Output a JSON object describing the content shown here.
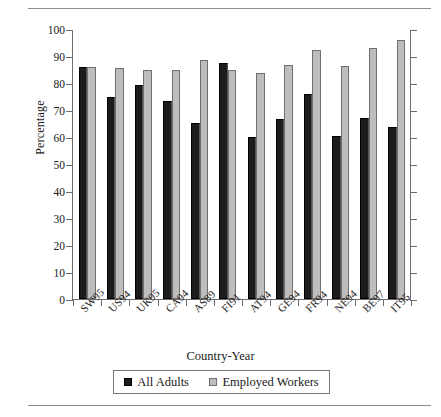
{
  "figure": {
    "top_rule": "horizontal-rule",
    "bottom_rule": "horizontal-rule"
  },
  "chart_data": {
    "type": "bar",
    "title": "",
    "xlabel": "Country-Year",
    "ylabel": "Percentage",
    "ylim": [
      0,
      100
    ],
    "ytick_step": 10,
    "ytick_labels": [
      "0",
      "10",
      "20",
      "30",
      "40",
      "50",
      "60",
      "70",
      "80",
      "90",
      "100"
    ],
    "grid": false,
    "legend_position": "bottom",
    "categories": [
      "SW95",
      "US94",
      "UK95",
      "CA94",
      "AS89",
      "FI91",
      "AT94",
      "GE94",
      "FR94",
      "NE94",
      "BE97",
      "IT95"
    ],
    "series": [
      {
        "name": "All Adults",
        "color": "#1c1c1c",
        "values": [
          86,
          74.7,
          79.3,
          73.5,
          65.3,
          87.5,
          60,
          66.6,
          75.8,
          60.2,
          67.2,
          63.7
        ]
      },
      {
        "name": "Employed Workers",
        "color": "#bdbdbd",
        "values": [
          86,
          85.4,
          84.7,
          84.8,
          88.7,
          85,
          83.6,
          86.5,
          92.3,
          86.2,
          92.9,
          96
        ]
      }
    ]
  },
  "legend": {
    "items": [
      {
        "label": "All Adults",
        "swatch": "dark-square-swatch"
      },
      {
        "label": "Employed Workers",
        "swatch": "light-square-swatch"
      }
    ]
  }
}
